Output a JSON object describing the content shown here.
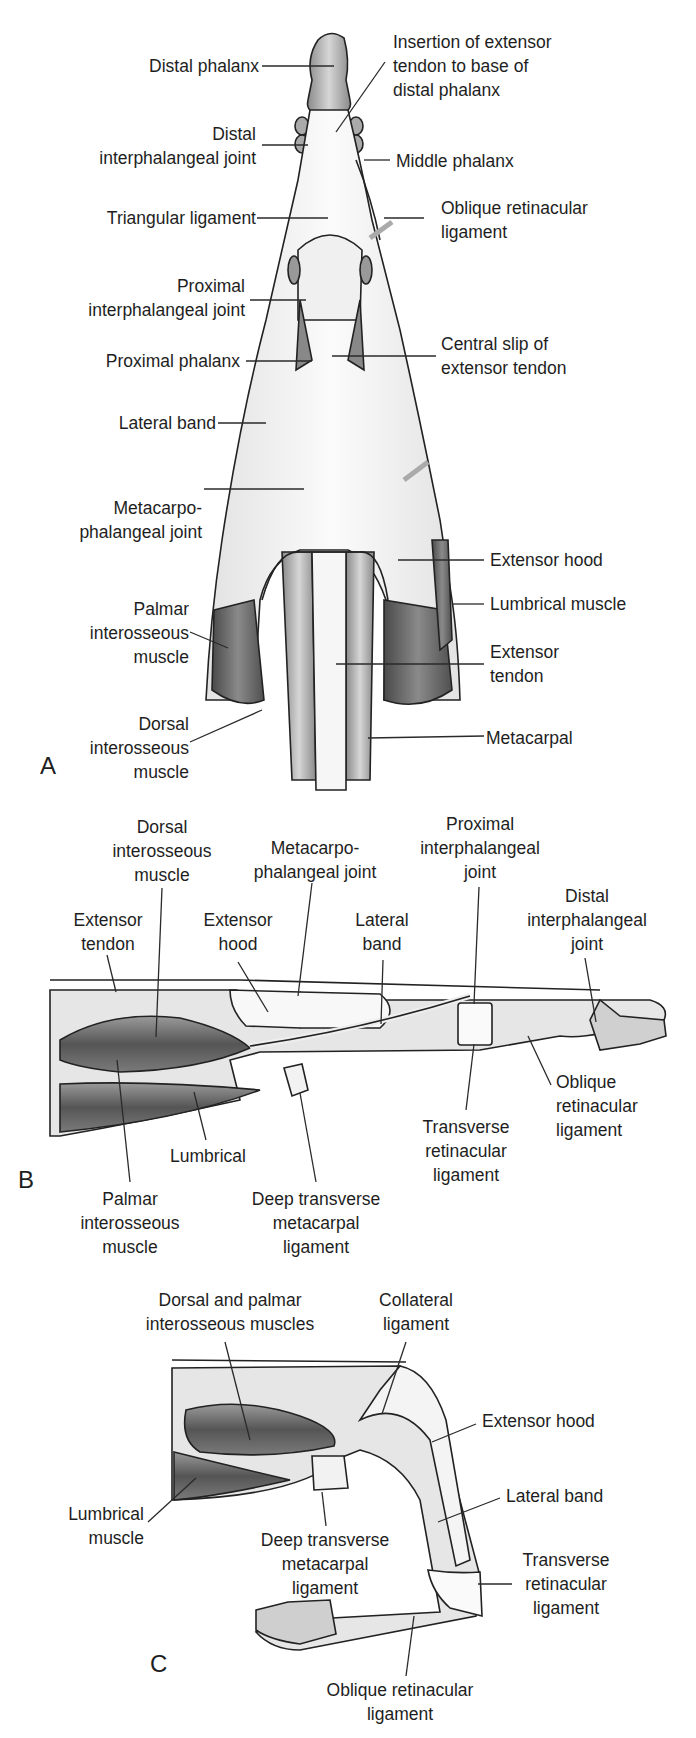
{
  "figure": {
    "panel_a": {
      "letter": "A",
      "view": "dorsal view",
      "labels": {
        "distal_phalanx": "Distal phalanx",
        "insertion": "Insertion of extensor\ntendon to base of\ndistal phalanx",
        "dip_joint": "Distal\ninterphalangeal joint",
        "middle_phalanx": "Middle phalanx",
        "triangular_ligament": "Triangular ligament",
        "oblique_retinacular": "Oblique retinacular\nligament",
        "pip_joint": "Proximal\ninterphalangeal joint",
        "proximal_phalanx": "Proximal phalanx",
        "central_slip": "Central slip of\nextensor tendon",
        "lateral_band": "Lateral band",
        "mcp_joint": "Metacarpo-\nphalangeal joint",
        "extensor_hood": "Extensor hood",
        "lumbrical": "Lumbrical muscle",
        "palmar_interosseous": "Palmar\ninterosseous\nmuscle",
        "extensor_tendon": "Extensor\ntendon",
        "dorsal_interosseous": "Dorsal\ninterosseous\nmuscle",
        "metacarpal": "Metacarpal"
      }
    },
    "panel_b": {
      "letter": "B",
      "view": "lateral view",
      "labels": {
        "dorsal_interosseous": "Dorsal\ninterosseous\nmuscle",
        "mcp_joint": "Metacarpo-\nphalangeal joint",
        "pip_joint": "Proximal\ninterphalangeal\njoint",
        "extensor_tendon": "Extensor\ntendon",
        "extensor_hood": "Extensor\nhood",
        "lateral_band": "Lateral\nband",
        "dip_joint": "Distal\ninterphalangeal\njoint",
        "oblique_retinacular": "Oblique\nretinacular\nligament",
        "transverse_retinacular": "Transverse\nretinacular\nligament",
        "lumbrical": "Lumbrical",
        "palmar_interosseous": "Palmar\ninterosseous\nmuscle",
        "deep_transverse": "Deep transverse\nmetacarpal\nligament"
      }
    },
    "panel_c": {
      "letter": "C",
      "view": "lateral view, finger flexed",
      "labels": {
        "interossei": "Dorsal and palmar\ninterosseous muscles",
        "collateral": "Collateral\nligament",
        "extensor_hood": "Extensor hood",
        "lumbrical": "Lumbrical\nmuscle",
        "lateral_band": "Lateral band",
        "deep_transverse": "Deep transverse\nmetacarpal\nligament",
        "transverse_retinacular": "Transverse\nretinacular\nligament",
        "oblique_retinacular": "Oblique retinacular\nligament"
      }
    },
    "colors": {
      "text": "#1e1e1e",
      "leader_line": "#2a2a2a",
      "tendon_fill": "#f4f4f4",
      "bone_fill": "#bdbdbd",
      "muscle_fill": "#6a6a6a",
      "outline": "#222222"
    }
  }
}
